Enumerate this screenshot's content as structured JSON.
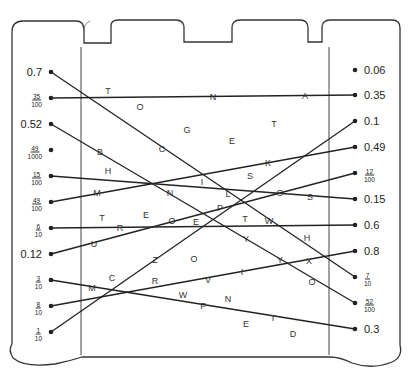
{
  "worksheet": {
    "left_values": [
      {
        "label": "0.7",
        "type": "decimal",
        "y": 72
      },
      {
        "label": "35/100",
        "num": "35",
        "den": "100",
        "type": "fraction",
        "y": 98
      },
      {
        "label": "0.52",
        "type": "decimal",
        "y": 124
      },
      {
        "label": "49/1000",
        "num": "49",
        "den": "1000",
        "type": "fraction",
        "y": 150
      },
      {
        "label": "15/100",
        "num": "15",
        "den": "100",
        "type": "fraction",
        "y": 176
      },
      {
        "label": "49/100",
        "num": "49",
        "den": "100",
        "type": "fraction",
        "y": 202
      },
      {
        "label": "6/10",
        "num": "6",
        "den": "10",
        "type": "fraction",
        "y": 228
      },
      {
        "label": "0.12",
        "type": "decimal",
        "y": 254
      },
      {
        "label": "3/10",
        "num": "3",
        "den": "10",
        "type": "fraction",
        "y": 280
      },
      {
        "label": "8/10",
        "num": "8",
        "den": "10",
        "type": "fraction",
        "y": 306
      },
      {
        "label": "1/10",
        "num": "1",
        "den": "10",
        "type": "fraction",
        "y": 332
      }
    ],
    "right_values": [
      {
        "label": "0.06",
        "type": "decimal",
        "y": 70
      },
      {
        "label": "0.35",
        "type": "decimal",
        "y": 95
      },
      {
        "label": "0.1",
        "type": "decimal",
        "y": 121
      },
      {
        "label": "0.49",
        "type": "decimal",
        "y": 147
      },
      {
        "label": "12/100",
        "num": "12",
        "den": "100",
        "type": "fraction",
        "y": 173
      },
      {
        "label": "0.15",
        "type": "decimal",
        "y": 199
      },
      {
        "label": "0.6",
        "type": "decimal",
        "y": 225
      },
      {
        "label": "0.8",
        "type": "decimal",
        "y": 251
      },
      {
        "label": "7/10",
        "num": "7",
        "den": "10",
        "type": "fraction",
        "y": 277
      },
      {
        "label": "52/100",
        "num": "52",
        "den": "100",
        "type": "fraction",
        "y": 303
      },
      {
        "label": "0.3",
        "type": "decimal",
        "y": 329
      }
    ],
    "connections": [
      {
        "from": 0,
        "to": 8
      },
      {
        "from": 1,
        "to": 1
      },
      {
        "from": 2,
        "to": 9
      },
      {
        "from": 4,
        "to": 5
      },
      {
        "from": 5,
        "to": 3
      },
      {
        "from": 6,
        "to": 6
      },
      {
        "from": 7,
        "to": 4
      },
      {
        "from": 8,
        "to": 10
      },
      {
        "from": 9,
        "to": 7
      },
      {
        "from": 10,
        "to": 2
      }
    ],
    "letters": [
      {
        "ch": "T",
        "x": 108,
        "y": 91
      },
      {
        "ch": "O",
        "x": 140,
        "y": 107
      },
      {
        "ch": "N",
        "x": 213,
        "y": 97
      },
      {
        "ch": "A",
        "x": 305,
        "y": 96
      },
      {
        "ch": "G",
        "x": 187,
        "y": 130
      },
      {
        "ch": "T",
        "x": 274,
        "y": 124
      },
      {
        "ch": "E",
        "x": 232,
        "y": 141
      },
      {
        "ch": "C",
        "x": 162,
        "y": 149
      },
      {
        "ch": "B",
        "x": 100,
        "y": 152
      },
      {
        "ch": "H",
        "x": 108,
        "y": 171
      },
      {
        "ch": "K",
        "x": 268,
        "y": 163
      },
      {
        "ch": "S",
        "x": 250,
        "y": 176
      },
      {
        "ch": "I",
        "x": 202,
        "y": 182
      },
      {
        "ch": "M",
        "x": 97,
        "y": 193
      },
      {
        "ch": "N",
        "x": 170,
        "y": 193
      },
      {
        "ch": "L",
        "x": 228,
        "y": 194
      },
      {
        "ch": "O",
        "x": 280,
        "y": 193
      },
      {
        "ch": "S",
        "x": 310,
        "y": 197
      },
      {
        "ch": "P",
        "x": 220,
        "y": 208
      },
      {
        "ch": "E",
        "x": 146,
        "y": 215
      },
      {
        "ch": "T",
        "x": 102,
        "y": 218
      },
      {
        "ch": "R",
        "x": 120,
        "y": 228
      },
      {
        "ch": "O",
        "x": 172,
        "y": 221
      },
      {
        "ch": "E",
        "x": 196,
        "y": 222
      },
      {
        "ch": "T",
        "x": 245,
        "y": 219
      },
      {
        "ch": "W",
        "x": 269,
        "y": 221
      },
      {
        "ch": "H",
        "x": 307,
        "y": 238
      },
      {
        "ch": "U",
        "x": 94,
        "y": 244
      },
      {
        "ch": "Y",
        "x": 246,
        "y": 239
      },
      {
        "ch": "Z",
        "x": 155,
        "y": 260
      },
      {
        "ch": "O",
        "x": 194,
        "y": 259
      },
      {
        "ch": "Y",
        "x": 280,
        "y": 260
      },
      {
        "ch": "X",
        "x": 309,
        "y": 261
      },
      {
        "ch": "C",
        "x": 112,
        "y": 278
      },
      {
        "ch": "R",
        "x": 155,
        "y": 281
      },
      {
        "ch": "I",
        "x": 242,
        "y": 272
      },
      {
        "ch": "V",
        "x": 208,
        "y": 280
      },
      {
        "ch": "O",
        "x": 312,
        "y": 282
      },
      {
        "ch": "M",
        "x": 92,
        "y": 288
      },
      {
        "ch": "W",
        "x": 183,
        "y": 295
      },
      {
        "ch": "N",
        "x": 228,
        "y": 299
      },
      {
        "ch": "F",
        "x": 203,
        "y": 306
      },
      {
        "ch": "E",
        "x": 246,
        "y": 324
      },
      {
        "ch": "T",
        "x": 273,
        "y": 318
      },
      {
        "ch": "D",
        "x": 293,
        "y": 334
      }
    ]
  },
  "layout": {
    "left_dot_x": 51,
    "right_dot_x": 355,
    "ink_color": "#222222"
  }
}
